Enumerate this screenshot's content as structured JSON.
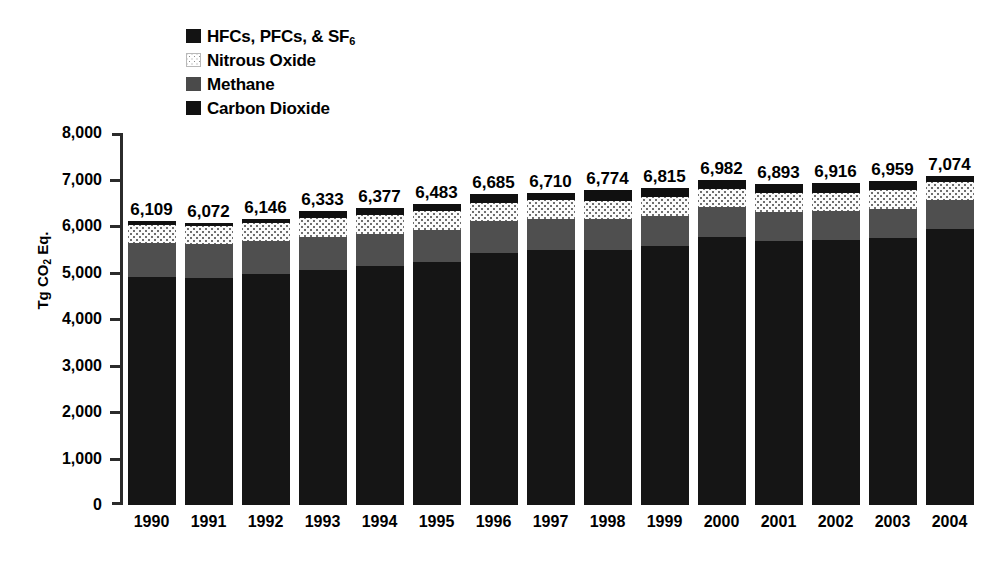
{
  "chart_data": {
    "type": "bar",
    "subtype": "stacked-bar",
    "title": "",
    "xlabel": "",
    "ylabel": "Tg CO2 Eq.",
    "ylabel_parts": {
      "prefix": "Tg CO",
      "sub": "2",
      "suffix": " Eq."
    },
    "ylim": [
      0,
      8000
    ],
    "ytick_values": [
      0,
      1000,
      2000,
      3000,
      4000,
      5000,
      6000,
      7000,
      8000
    ],
    "ytick_labels": [
      "0",
      "1,000",
      "2,000",
      "3,000",
      "4,000",
      "5,000",
      "6,000",
      "7,000",
      "8,000"
    ],
    "grid": false,
    "legend_position": "top-left",
    "categories": [
      "1990",
      "1991",
      "1992",
      "1993",
      "1994",
      "1995",
      "1996",
      "1997",
      "1998",
      "1999",
      "2000",
      "2001",
      "2002",
      "2003",
      "2004"
    ],
    "series": [
      {
        "name": "Carbon Dioxide",
        "color": "#151515",
        "swatch": "solid-black",
        "values": [
          4900,
          4880,
          4960,
          5060,
          5130,
          5230,
          5420,
          5480,
          5480,
          5560,
          5760,
          5670,
          5690,
          5740,
          5940
        ]
      },
      {
        "name": "Methane",
        "color": "#4f4f4f",
        "swatch": "solid-dark-gray",
        "values": [
          730,
          725,
          720,
          710,
          705,
          690,
          680,
          675,
          665,
          655,
          640,
          635,
          630,
          625,
          620
        ]
      },
      {
        "name": "Nitrous Oxide",
        "color": "#fbfbfb",
        "swatch": "dotted-light",
        "values": [
          390,
          385,
          390,
          400,
          395,
          400,
          400,
          405,
          400,
          400,
          400,
          395,
          400,
          400,
          395
        ]
      },
      {
        "name": "HFCs, PFCs, & SF6",
        "color": "#101010",
        "swatch": "solid-black",
        "values": [
          89,
          82,
          76,
          163,
          147,
          163,
          185,
          150,
          229,
          200,
          182,
          193,
          196,
          194,
          119
        ]
      }
    ],
    "totals": [
      6109,
      6072,
      6146,
      6333,
      6377,
      6483,
      6685,
      6710,
      6774,
      6815,
      6982,
      6893,
      6916,
      6959,
      7074
    ],
    "total_labels": [
      "6,109",
      "6,072",
      "6,146",
      "6,333",
      "6,377",
      "6,483",
      "6,685",
      "6,710",
      "6,774",
      "6,815",
      "6,982",
      "6,893",
      "6,916",
      "6,959",
      "7,074"
    ]
  },
  "legend": {
    "items": [
      {
        "label_prefix": "HFCs, PFCs, & SF",
        "label_sub": "6",
        "label_suffix": "",
        "swatch_class": "sw-hfc",
        "name": "hfc-pfc-sf6"
      },
      {
        "label_prefix": "Nitrous Oxide",
        "label_sub": "",
        "label_suffix": "",
        "swatch_class": "sw-n2o",
        "name": "nitrous-oxide"
      },
      {
        "label_prefix": "Methane",
        "label_sub": "",
        "label_suffix": "",
        "swatch_class": "sw-ch4",
        "name": "methane"
      },
      {
        "label_prefix": "Carbon Dioxide",
        "label_sub": "",
        "label_suffix": "",
        "swatch_class": "sw-co2",
        "name": "carbon-dioxide"
      }
    ]
  }
}
